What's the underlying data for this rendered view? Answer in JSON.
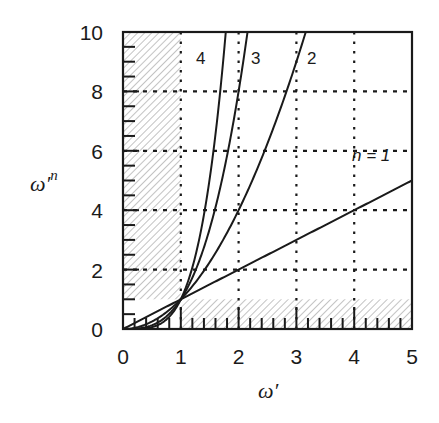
{
  "chart_data": {
    "type": "line",
    "title": "",
    "xlabel": "ω′",
    "ylabel": "ω′ⁿ",
    "xlim": [
      0,
      5
    ],
    "ylim": [
      0,
      10
    ],
    "xticks": [
      0,
      1,
      2,
      3,
      4,
      5
    ],
    "yticks": [
      0,
      2,
      4,
      6,
      8,
      10
    ],
    "x_minor_step": 0.2,
    "y_minor_step": 0.5,
    "grid": "dotted",
    "legend": "inline labels",
    "shaded_regions": [
      {
        "description": "hatched region x in [0,1], y in [1,10]"
      },
      {
        "description": "hatched region x in [1,5], y in [0,1]"
      }
    ],
    "series": [
      {
        "name": "n = 1",
        "label": "n = 1",
        "formula": "y = x",
        "x": [
          0,
          1,
          2,
          3,
          4,
          5
        ],
        "values": [
          0,
          1,
          2,
          3,
          4,
          5
        ]
      },
      {
        "name": "n = 2",
        "label": "2",
        "formula": "y = x^2",
        "x": [
          0,
          1,
          2,
          3,
          3.162
        ],
        "values": [
          0,
          1,
          4,
          9,
          10
        ]
      },
      {
        "name": "n = 3",
        "label": "3",
        "formula": "y = x^3",
        "x": [
          0,
          1,
          1.5,
          2,
          2.154
        ],
        "values": [
          0,
          1,
          3.375,
          8,
          10
        ]
      },
      {
        "name": "n = 4",
        "label": "4",
        "formula": "y = x^4",
        "x": [
          0,
          1,
          1.5,
          1.778
        ],
        "values": [
          0,
          1,
          5.0625,
          10
        ]
      }
    ]
  },
  "labels": {
    "x_axis": "ω′",
    "y_axis_base": "ω′",
    "y_axis_exp": "n",
    "n1": "n = 1",
    "n2": "2",
    "n3": "3",
    "n4": "4"
  },
  "colors": {
    "ink": "#1a1a1a",
    "hatch": "#9a9a9a",
    "background": "#ffffff"
  }
}
